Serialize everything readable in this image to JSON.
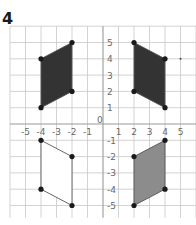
{
  "question_number": "4",
  "grid": {
    "x_range": [
      -6,
      6
    ],
    "y_range": [
      -6,
      6
    ],
    "origin_label": "0",
    "x_tick_labels": [
      "-5",
      "-4",
      "-3",
      "-2",
      "-1",
      "1",
      "2",
      "3",
      "4",
      "5"
    ],
    "y_tick_labels": [
      "5",
      "4",
      "3",
      "2",
      "1",
      "-1",
      "-2",
      "-3",
      "-4",
      "-5"
    ]
  },
  "colors": {
    "dark_fill": "#333333",
    "gray_fill": "#8c8c8c",
    "white_fill": "#ffffff",
    "outline": "#555555",
    "vertex": "#1a1a1a",
    "grid": "#c8c8c8",
    "axis": "#9a9a9a"
  },
  "shapes": [
    {
      "name": "parallelogram-top-left",
      "quadrant": 2,
      "fill": "dark",
      "vertices": [
        [
          -2,
          5
        ],
        [
          -4,
          4
        ],
        [
          -4,
          1
        ],
        [
          -2,
          2
        ]
      ]
    },
    {
      "name": "parallelogram-top-right",
      "quadrant": 1,
      "fill": "dark",
      "vertices": [
        [
          2,
          5
        ],
        [
          4,
          4
        ],
        [
          4,
          1
        ],
        [
          2,
          2
        ]
      ]
    },
    {
      "name": "parallelogram-bottom-left",
      "quadrant": 3,
      "fill": "white",
      "vertices": [
        [
          -4,
          -1
        ],
        [
          -2,
          -2
        ],
        [
          -2,
          -5
        ],
        [
          -4,
          -4
        ]
      ]
    },
    {
      "name": "parallelogram-bottom-right",
      "quadrant": 4,
      "fill": "gray",
      "vertices": [
        [
          4,
          -1
        ],
        [
          2,
          -2
        ],
        [
          2,
          -5
        ],
        [
          4,
          -4
        ]
      ]
    }
  ],
  "stray_mark": {
    "x": 5,
    "y": 4
  }
}
